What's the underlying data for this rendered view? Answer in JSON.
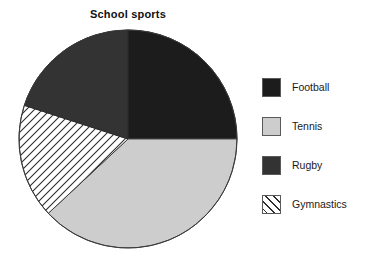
{
  "chart_data": {
    "type": "pie",
    "title": "School sports",
    "xlabel": "",
    "ylabel": "",
    "legend_position": "right",
    "grid": false,
    "categories": [
      "Football",
      "Tennis",
      "Rugby",
      "Gymnastics"
    ],
    "values": [
      25,
      38,
      20,
      17
    ],
    "units": "percent",
    "slices": [
      {
        "label": "Football",
        "value": 25,
        "start_angle_deg": 0,
        "end_angle_deg": 90,
        "fill": "#1c1c1c",
        "pattern": "solid",
        "stroke": "#2a2a2a"
      },
      {
        "label": "Tennis",
        "value": 38,
        "start_angle_deg": 90,
        "end_angle_deg": 227,
        "fill": "#cdcdcd",
        "pattern": "solid",
        "stroke": "#4a4a4a"
      },
      {
        "label": "Gymnastics",
        "value": 17,
        "start_angle_deg": 227,
        "end_angle_deg": 288,
        "fill": "#ffffff",
        "pattern": "diagonal-hatch",
        "stroke": "#3a3a3a"
      },
      {
        "label": "Rugby",
        "value": 20,
        "start_angle_deg": 288,
        "end_angle_deg": 360,
        "fill": "#333333",
        "pattern": "solid",
        "stroke": "#2a2a2a"
      }
    ],
    "center": {
      "x": 128,
      "y": 139
    },
    "radius": 109,
    "start_angle_offset_deg": 0,
    "direction": "clockwise"
  },
  "legend": {
    "items": [
      {
        "label": "Football",
        "swatch": "#1c1c1c",
        "pattern": "solid",
        "swatch_name": "legend-swatch-football"
      },
      {
        "label": "Tennis",
        "swatch": "#cdcdcd",
        "pattern": "solid",
        "swatch_name": "legend-swatch-tennis"
      },
      {
        "label": "Rugby",
        "swatch": "#333333",
        "pattern": "solid",
        "swatch_name": "legend-swatch-rugby"
      },
      {
        "label": "Gymnastics",
        "swatch": "#ffffff",
        "pattern": "diagonal-hatch",
        "swatch_name": "legend-swatch-gymnastics"
      }
    ]
  },
  "colors": {
    "background": "#ffffff",
    "text": "#1a1a1a",
    "outline": "#3a3a3a",
    "football": "#1c1c1c",
    "tennis": "#cdcdcd",
    "rugby": "#333333",
    "gymnastics": "#ffffff"
  }
}
